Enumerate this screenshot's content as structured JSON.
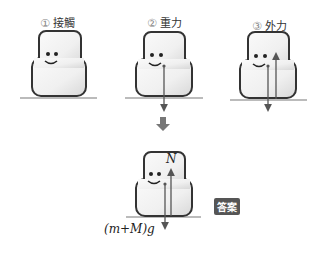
{
  "panels": [
    {
      "num": "①",
      "title": "接觸"
    },
    {
      "num": "②",
      "title": "重力"
    },
    {
      "num": "③",
      "title": "外力"
    }
  ],
  "answer": {
    "badge": "答案",
    "normal_force": "N",
    "weight": "(m+M)g"
  }
}
